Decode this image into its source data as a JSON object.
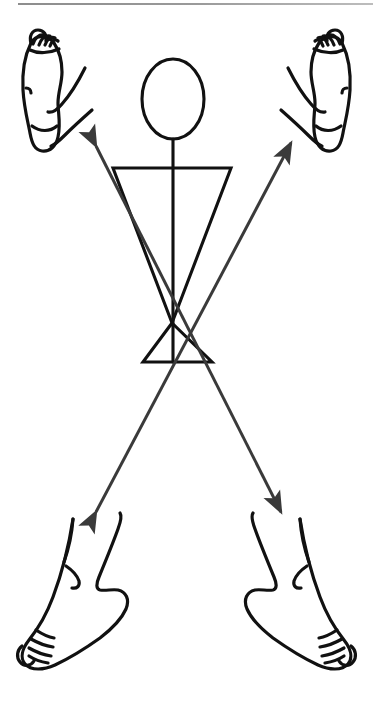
{
  "figure": {
    "title": "Crossed reflex stick figure with four feet",
    "caption": "",
    "background_color": "#ffffff",
    "ink_color": "#111111",
    "arrow_color": "#3a3a3a",
    "rule_color": "#9a9a9a",
    "width": 373,
    "height": 705
  },
  "rule": {
    "name": "top-divider"
  },
  "stick_figure": {
    "head": {
      "label": "head",
      "shape": "ellipse",
      "cx": 173,
      "cy": 99,
      "rx": 31,
      "ry": 40
    },
    "neck": {
      "label": "neck",
      "x1": 173,
      "y1": 139,
      "x2": 173,
      "y2": 168
    },
    "shoulders": {
      "label": "shoulder-triangle",
      "points": "113,168 231,168 172,323"
    },
    "hips": {
      "label": "hip-triangle",
      "points": "172,323 143,362 212,362"
    },
    "spine": {
      "label": "spine",
      "x1": 173,
      "y1": 139,
      "x2": 173,
      "y2": 362
    }
  },
  "arrows": [
    {
      "name": "arrow-lower-left-to-upper-right",
      "from_label": "left foot (lower left)",
      "to_label": "right foot (upper right)",
      "tail_x": 96,
      "tail_y": 512,
      "head_x": 291,
      "head_y": 143,
      "double_headed": true,
      "color": "#3a3a3a"
    },
    {
      "name": "arrow-upper-left-to-lower-right",
      "from_label": "left foot (upper left)",
      "to_label": "right foot (lower right)",
      "tail_x": 96,
      "tail_y": 146,
      "head_x": 281,
      "head_y": 512,
      "double_headed": true,
      "color": "#3a3a3a"
    }
  ],
  "feet": [
    {
      "name": "foot-upper-left",
      "label": "Upper left foot",
      "view": "sole",
      "side": "left",
      "position": "top-left",
      "toes": 5
    },
    {
      "name": "foot-upper-right",
      "label": "Upper right foot",
      "view": "sole",
      "side": "right",
      "position": "top-right",
      "toes": 5
    },
    {
      "name": "foot-lower-left",
      "label": "Lower left foot",
      "view": "dorsal",
      "side": "left",
      "position": "bottom-left",
      "toes": 5
    },
    {
      "name": "foot-lower-right",
      "label": "Lower right foot",
      "view": "dorsal",
      "side": "right",
      "position": "bottom-right",
      "toes": 5
    }
  ]
}
